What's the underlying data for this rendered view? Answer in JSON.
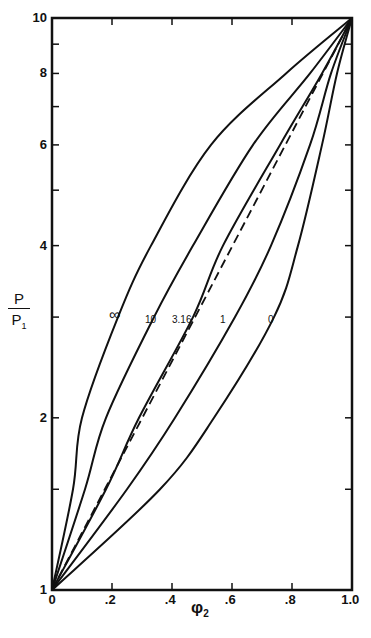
{
  "chart_data": {
    "type": "line",
    "title": "",
    "xlabel": "φ2",
    "ylabel": "P / P1",
    "xlim": [
      0,
      1.0
    ],
    "ylim": [
      1,
      10
    ],
    "yscale": "log",
    "grid": false,
    "legend": "inline curve labels",
    "x_ticks": [
      "0",
      ".2",
      ".4",
      ".6",
      ".8",
      "1.0"
    ],
    "x_tick_values": [
      0,
      0.2,
      0.4,
      0.6,
      0.8,
      1.0
    ],
    "y_ticks": [
      "1",
      "2",
      "4",
      "6",
      "8",
      "10"
    ],
    "y_tick_values": [
      1,
      2,
      4,
      6,
      8,
      10
    ],
    "y_minor_ticks": [
      1.5,
      3,
      5,
      7,
      9
    ],
    "series": [
      {
        "name": "∞",
        "style": "solid",
        "points": [
          [
            0,
            1
          ],
          [
            0.07,
            1.5
          ],
          [
            0.1,
            2
          ],
          [
            0.22,
            3
          ],
          [
            0.33,
            4
          ],
          [
            0.53,
            6
          ],
          [
            0.78,
            8
          ],
          [
            1.0,
            10
          ]
        ]
      },
      {
        "name": "10",
        "style": "solid",
        "points": [
          [
            0,
            1
          ],
          [
            0.11,
            1.5
          ],
          [
            0.18,
            2
          ],
          [
            0.34,
            3
          ],
          [
            0.47,
            4
          ],
          [
            0.67,
            6
          ],
          [
            0.86,
            8
          ],
          [
            1.0,
            10
          ]
        ]
      },
      {
        "name": "3.16",
        "style": "solid",
        "points": [
          [
            0,
            1
          ],
          [
            0.18,
            1.5
          ],
          [
            0.29,
            2
          ],
          [
            0.47,
            3
          ],
          [
            0.57,
            4
          ],
          [
            0.76,
            6
          ],
          [
            0.9,
            8
          ],
          [
            1.0,
            10
          ]
        ]
      },
      {
        "name": "ideal (dashed)",
        "style": "dashed",
        "points": [
          [
            0,
            1
          ],
          [
            0.176,
            1.5
          ],
          [
            0.301,
            2
          ],
          [
            0.477,
            3
          ],
          [
            0.602,
            4
          ],
          [
            0.778,
            6
          ],
          [
            0.903,
            8
          ],
          [
            1.0,
            10
          ]
        ]
      },
      {
        "name": "1",
        "style": "solid",
        "points": [
          [
            0,
            1
          ],
          [
            0.25,
            1.5
          ],
          [
            0.41,
            2
          ],
          [
            0.61,
            3
          ],
          [
            0.73,
            4
          ],
          [
            0.86,
            6
          ],
          [
            0.93,
            8
          ],
          [
            1.0,
            10
          ]
        ]
      },
      {
        "name": "0",
        "style": "solid",
        "points": [
          [
            0,
            1
          ],
          [
            0.36,
            1.5
          ],
          [
            0.54,
            2
          ],
          [
            0.74,
            3
          ],
          [
            0.82,
            4
          ],
          [
            0.9,
            6
          ],
          [
            0.95,
            8
          ],
          [
            1.0,
            10
          ]
        ]
      }
    ],
    "annotations": [
      {
        "text": "∞",
        "x": 0.21,
        "y": 3.05
      },
      {
        "text": "10",
        "x": 0.33,
        "y": 2.95
      },
      {
        "text": "3.16",
        "x": 0.42,
        "y": 2.95
      },
      {
        "text": "1",
        "x": 0.58,
        "y": 2.95
      },
      {
        "text": "0",
        "x": 0.74,
        "y": 2.95
      }
    ]
  },
  "labels": {
    "xlabel_main": "φ",
    "xlabel_sub": "2",
    "ylabel_num": "P",
    "ylabel_den": "P",
    "ylabel_den_sub": "1",
    "x_ticks": [
      "0",
      ".2",
      ".4",
      ".6",
      ".8",
      "1.0"
    ],
    "y_ticks": [
      "1",
      "2",
      "4",
      "6",
      "8",
      "10"
    ],
    "curve_labels": [
      "∞",
      "10",
      "3.16",
      "1",
      "0"
    ]
  }
}
